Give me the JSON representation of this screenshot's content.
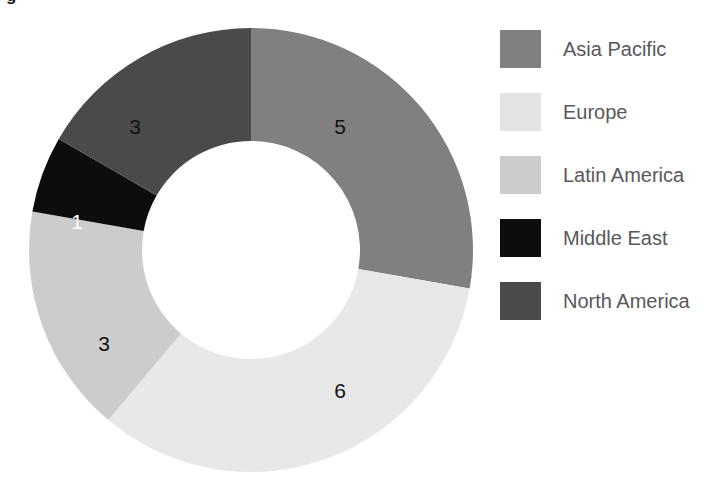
{
  "figure": {
    "caption_remnant": "g",
    "background": "#ffffff"
  },
  "chart_data": {
    "type": "pie",
    "variant": "donut",
    "title": "",
    "xlabel": "",
    "ylabel": "",
    "legend_position": "right",
    "grid": false,
    "start_angle_deg": 0,
    "direction": "clockwise",
    "inner_radius_ratio": 0.49,
    "total": 18,
    "categories": [
      "Asia Pacific",
      "Europe",
      "Latin America",
      "Middle East",
      "North America"
    ],
    "values": [
      5,
      6,
      3,
      1,
      3
    ],
    "colors": [
      "#808080",
      "#e8e8e8",
      "#cccccc",
      "#0d0d0d",
      "#4a4a4a"
    ],
    "slices": [
      {
        "name": "Asia Pacific",
        "value": 5,
        "label": "5",
        "color": "#808080",
        "label_color": "#111111",
        "start_deg": 0,
        "end_deg": 100,
        "label_x": 340,
        "label_y": 128
      },
      {
        "name": "Europe",
        "value": 6,
        "label": "6",
        "color": "#e8e8e8",
        "label_color": "#111111",
        "start_deg": 100,
        "end_deg": 220,
        "label_x": 340,
        "label_y": 392
      },
      {
        "name": "Latin America",
        "value": 3,
        "label": "3",
        "color": "#cccccc",
        "label_color": "#111111",
        "start_deg": 220,
        "end_deg": 280,
        "label_x": 104,
        "label_y": 345
      },
      {
        "name": "Middle East",
        "value": 1,
        "label": "1",
        "color": "#0d0d0d",
        "label_color": "#ffffff",
        "start_deg": 280,
        "end_deg": 300,
        "label_x": 77,
        "label_y": 223
      },
      {
        "name": "North America",
        "value": 3,
        "label": "3",
        "color": "#4a4a4a",
        "label_color": "#111111",
        "start_deg": 300,
        "end_deg": 360,
        "label_x": 135,
        "label_y": 128
      }
    ],
    "geometry": {
      "center_x": 251,
      "center_y": 250,
      "outer_radius": 222,
      "inner_radius": 109
    }
  },
  "legend": {
    "items": [
      {
        "label": "Asia Pacific",
        "color": "#808080",
        "top": 14
      },
      {
        "label": "Europe",
        "color": "#e3e3e3",
        "top": 77
      },
      {
        "label": "Latin America",
        "color": "#cccccc",
        "top": 140
      },
      {
        "label": "Middle East",
        "color": "#0d0d0d",
        "top": 203
      },
      {
        "label": "North America",
        "color": "#4a4a4a",
        "top": 266
      }
    ]
  }
}
